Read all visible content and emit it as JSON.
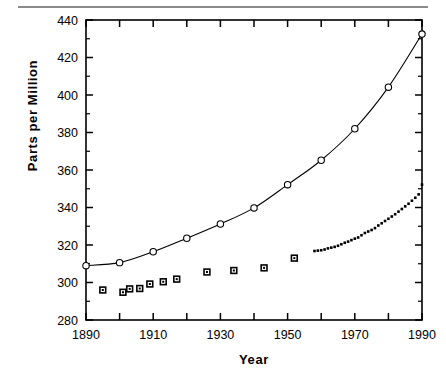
{
  "figure": {
    "axis_title_y": "Parts per Million",
    "axis_title_x": "Year",
    "top_rule_color": "#8a8a8a"
  },
  "chart_data": {
    "type": "line",
    "title": "",
    "subtitle": "",
    "xlabel": "Year",
    "ylabel": "Parts per Million",
    "xlim": [
      1890,
      1990
    ],
    "ylim": [
      280,
      440
    ],
    "xticks": [
      1890,
      1900,
      1910,
      1920,
      1930,
      1940,
      1950,
      1960,
      1970,
      1980,
      1990
    ],
    "xtick_labels": [
      "1890",
      "",
      "1910",
      "",
      "1930",
      "",
      "1950",
      "",
      "1970",
      "",
      "1990"
    ],
    "xtick_major_labeled": [
      1890,
      1910,
      1930,
      1950,
      1970,
      1990
    ],
    "yticks": [
      280,
      300,
      320,
      340,
      360,
      380,
      400,
      420,
      440
    ],
    "ytick_labels": [
      "280",
      "300",
      "320",
      "340",
      "360",
      "380",
      "400",
      "420",
      "440"
    ],
    "grid": false,
    "legend": "none",
    "series": [
      {
        "name": "Smoothed trend (open circles)",
        "marker": "open-circle",
        "line": true,
        "x": [
          1890,
          1900,
          1910,
          1920,
          1930,
          1940,
          1950,
          1960,
          1970,
          1980,
          1990
        ],
        "values": [
          309.0,
          310.6,
          316.4,
          323.6,
          331.2,
          339.8,
          352.2,
          365.2,
          382.0,
          404.2,
          432.5
        ]
      },
      {
        "name": "Ice core record (filled squares)",
        "marker": "filled-square",
        "line": false,
        "x": [
          1895,
          1901,
          1903,
          1906,
          1909,
          1913,
          1917,
          1926,
          1934,
          1943,
          1952
        ],
        "values": [
          296.0,
          294.8,
          296.6,
          296.8,
          299.2,
          300.4,
          301.8,
          305.6,
          306.4,
          307.8,
          313.0
        ]
      },
      {
        "name": "Mauna Loa record (small dots)",
        "marker": "small-dot",
        "line": false,
        "x": [
          1958,
          1959,
          1960,
          1961,
          1962,
          1963,
          1964,
          1965,
          1966,
          1967,
          1968,
          1969,
          1970,
          1971,
          1972,
          1973,
          1974,
          1975,
          1976,
          1977,
          1978,
          1979,
          1980,
          1981,
          1982,
          1983,
          1984,
          1985,
          1986,
          1987,
          1988,
          1989,
          1990
        ],
        "values": [
          316.8,
          317.0,
          317.2,
          317.6,
          318.2,
          318.6,
          319.0,
          319.6,
          320.4,
          321.2,
          321.8,
          322.6,
          323.4,
          324.0,
          325.2,
          326.4,
          327.2,
          328.0,
          329.0,
          330.4,
          331.6,
          332.8,
          334.0,
          335.2,
          336.4,
          337.8,
          339.2,
          340.6,
          342.0,
          343.6,
          345.2,
          347.0,
          352.2
        ]
      }
    ]
  }
}
